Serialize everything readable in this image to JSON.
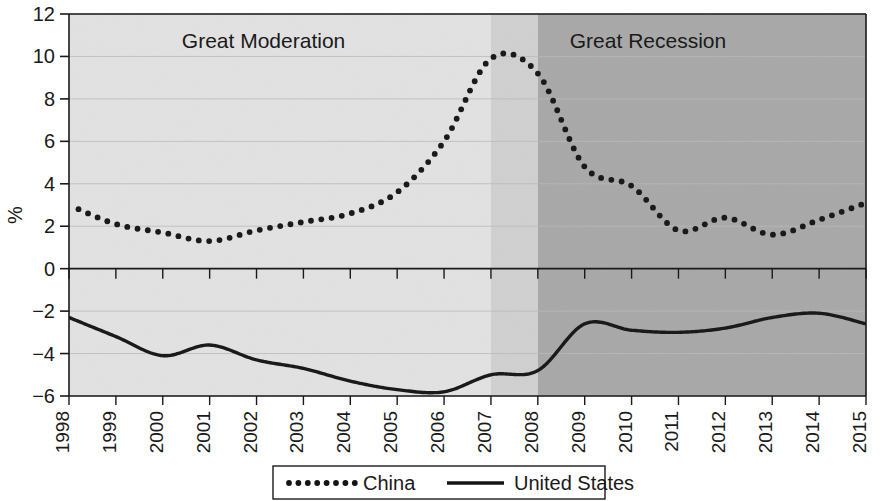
{
  "chart_data": {
    "type": "line",
    "title": "",
    "subtitle": "",
    "xlabel": "",
    "ylabel": "%",
    "xlim": [
      1998,
      2015
    ],
    "ylim": [
      -6,
      12
    ],
    "yticks": [
      -6,
      -4,
      -2,
      0,
      2,
      4,
      6,
      8,
      10,
      12
    ],
    "ytick_labels": [
      "−6",
      "−4",
      "−2",
      "0",
      "2",
      "4",
      "6",
      "8",
      "10",
      "12"
    ],
    "categories": [
      "1998",
      "1999",
      "2000",
      "2001",
      "2002",
      "2003",
      "2004",
      "2005",
      "2006",
      "2007",
      "2008",
      "2009",
      "2010",
      "2011",
      "2012",
      "2013",
      "2014",
      "2015"
    ],
    "x": [
      1998,
      1999,
      2000,
      2001,
      2002,
      2003,
      2004,
      2005,
      2006,
      2007,
      2008,
      2009,
      2010,
      2011,
      2012,
      2013,
      2014,
      2015
    ],
    "grid": true,
    "legend_position": "bottom",
    "series": [
      {
        "name": "China",
        "style": "dotted",
        "color": "#1a1a1a",
        "values": [
          3.0,
          2.1,
          1.7,
          1.3,
          1.8,
          2.2,
          2.6,
          3.6,
          6.0,
          9.9,
          9.2,
          4.8,
          3.9,
          1.8,
          2.4,
          1.6,
          2.3,
          3.1
        ]
      },
      {
        "name": "United States",
        "style": "solid",
        "color": "#1a1a1a",
        "values": [
          -2.3,
          -3.2,
          -4.1,
          -3.6,
          -4.3,
          -4.7,
          -5.3,
          -5.7,
          -5.8,
          -5.0,
          -4.8,
          -2.6,
          -2.9,
          -3.0,
          -2.8,
          -2.3,
          -2.1,
          -2.6
        ]
      }
    ],
    "annotations": [
      {
        "label": "Great Moderation",
        "x_start": 1998,
        "x_end": 2007,
        "band_color": "#e2e2e2"
      },
      {
        "label": "",
        "x_start": 2007,
        "x_end": 2008,
        "band_color": "#d0d0d0"
      },
      {
        "label": "Great Recession",
        "x_start": 2008,
        "x_end": 2015,
        "band_color": "#a8a8a8"
      }
    ]
  },
  "legend": {
    "items": [
      {
        "label": "China",
        "marker": "dotted-line-swatch"
      },
      {
        "label": "United States",
        "marker": "solid-line-swatch"
      }
    ]
  },
  "axis": {
    "y_title": "%"
  }
}
